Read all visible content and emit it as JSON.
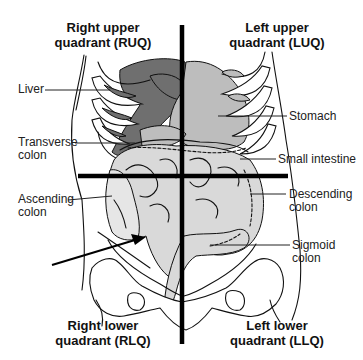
{
  "diagram": {
    "quadrants": [
      {
        "id": "ruq",
        "line1": "Right upper",
        "line2": "quadrant (RUQ)"
      },
      {
        "id": "luq",
        "line1": "Left upper",
        "line2": "quadrant (LUQ)"
      },
      {
        "id": "rlq",
        "line1": "Right lower",
        "line2": "quadrant (RLQ)"
      },
      {
        "id": "llq",
        "line1": "Left lower",
        "line2": "quadrant (LLQ)"
      }
    ],
    "organ_labels": [
      {
        "id": "liver",
        "line1": "Liver",
        "line2": ""
      },
      {
        "id": "transverse-colon",
        "line1": "Transverse",
        "line2": "colon"
      },
      {
        "id": "ascending-colon",
        "line1": "Ascending",
        "line2": "colon"
      },
      {
        "id": "stomach",
        "line1": "Stomach",
        "line2": ""
      },
      {
        "id": "small-intestine",
        "line1": "Small intestine",
        "line2": ""
      },
      {
        "id": "descending-colon",
        "line1": "Descending",
        "line2": "colon"
      },
      {
        "id": "sigmoid-colon",
        "line1": "Sigmoid",
        "line2": "colon"
      }
    ],
    "pointer_arrow": {
      "target": "appendix region (RLQ)"
    },
    "colors": {
      "crosshair": "#000000",
      "liver": "#6f6f6f",
      "stomach": "#bdbdbd",
      "intestine": "#d9d9d9",
      "background": "#ffffff",
      "text": "#111111"
    }
  }
}
